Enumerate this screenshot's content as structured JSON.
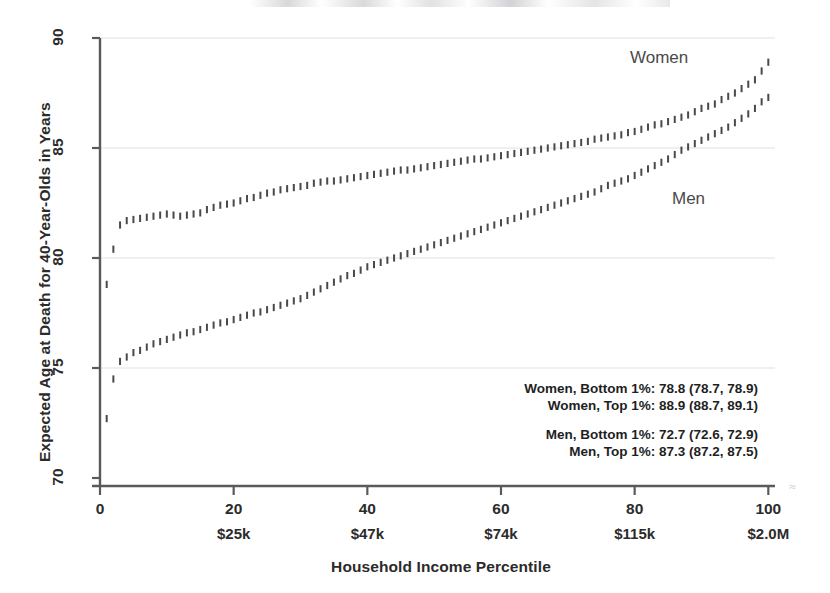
{
  "chart_data": {
    "type": "scatter",
    "title": "",
    "xlabel": "Household Income Percentile",
    "ylabel": "Expected Age at Death for 40-Year-Olds in Years",
    "xlim": [
      0,
      101
    ],
    "ylim": [
      70,
      90
    ],
    "xticks": [
      0,
      20,
      40,
      60,
      80,
      100
    ],
    "xtick_labels": [
      "0",
      "20",
      "40",
      "60",
      "80",
      "100"
    ],
    "secondary_xtick_labels": [
      "",
      "$25k",
      "$47k",
      "$74k",
      "$115k",
      "$2.0M"
    ],
    "yticks": [
      70,
      75,
      80,
      85,
      90
    ],
    "ytick_labels": [
      "70",
      "75",
      "80",
      "85",
      "90"
    ],
    "grid": "horizontal",
    "legend_position": "inline-annotation",
    "marker": "error-bar",
    "series": [
      {
        "name": "Women",
        "color": "#3a3a3a",
        "label_x": 630,
        "label_y": 48,
        "x": [
          1,
          2,
          3,
          4,
          5,
          6,
          7,
          8,
          9,
          10,
          11,
          12,
          13,
          14,
          15,
          16,
          17,
          18,
          19,
          20,
          21,
          22,
          23,
          24,
          25,
          26,
          27,
          28,
          29,
          30,
          31,
          32,
          33,
          34,
          35,
          36,
          37,
          38,
          39,
          40,
          41,
          42,
          43,
          44,
          45,
          46,
          47,
          48,
          49,
          50,
          51,
          52,
          53,
          54,
          55,
          56,
          57,
          58,
          59,
          60,
          61,
          62,
          63,
          64,
          65,
          66,
          67,
          68,
          69,
          70,
          71,
          72,
          73,
          74,
          75,
          76,
          77,
          78,
          79,
          80,
          81,
          82,
          83,
          84,
          85,
          86,
          87,
          88,
          89,
          90,
          91,
          92,
          93,
          94,
          95,
          96,
          97,
          98,
          99,
          100
        ],
        "values": [
          78.8,
          80.4,
          81.5,
          81.7,
          81.75,
          81.8,
          81.85,
          81.9,
          81.95,
          82.0,
          81.95,
          81.9,
          81.95,
          82.0,
          82.05,
          82.2,
          82.3,
          82.4,
          82.45,
          82.5,
          82.6,
          82.7,
          82.75,
          82.85,
          82.95,
          83.0,
          83.1,
          83.15,
          83.2,
          83.25,
          83.3,
          83.4,
          83.45,
          83.5,
          83.5,
          83.55,
          83.6,
          83.65,
          83.7,
          83.75,
          83.8,
          83.85,
          83.9,
          83.95,
          84.0,
          84.0,
          84.05,
          84.1,
          84.15,
          84.2,
          84.25,
          84.3,
          84.35,
          84.4,
          84.45,
          84.5,
          84.5,
          84.55,
          84.6,
          84.65,
          84.7,
          84.75,
          84.8,
          84.85,
          84.9,
          84.95,
          85.0,
          85.05,
          85.1,
          85.15,
          85.2,
          85.25,
          85.3,
          85.4,
          85.45,
          85.5,
          85.55,
          85.6,
          85.7,
          85.75,
          85.85,
          85.95,
          86.05,
          86.1,
          86.2,
          86.3,
          86.4,
          86.5,
          86.65,
          86.8,
          86.9,
          87.0,
          87.2,
          87.35,
          87.5,
          87.7,
          87.9,
          88.1,
          88.5,
          88.9
        ]
      },
      {
        "name": "Men",
        "color": "#3a3a3a",
        "label_x": 672,
        "label_y": 189,
        "x": [
          1,
          2,
          3,
          4,
          5,
          6,
          7,
          8,
          9,
          10,
          11,
          12,
          13,
          14,
          15,
          16,
          17,
          18,
          19,
          20,
          21,
          22,
          23,
          24,
          25,
          26,
          27,
          28,
          29,
          30,
          31,
          32,
          33,
          34,
          35,
          36,
          37,
          38,
          39,
          40,
          41,
          42,
          43,
          44,
          45,
          46,
          47,
          48,
          49,
          50,
          51,
          52,
          53,
          54,
          55,
          56,
          57,
          58,
          59,
          60,
          61,
          62,
          63,
          64,
          65,
          66,
          67,
          68,
          69,
          70,
          71,
          72,
          73,
          74,
          75,
          76,
          77,
          78,
          79,
          80,
          81,
          82,
          83,
          84,
          85,
          86,
          87,
          88,
          89,
          90,
          91,
          92,
          93,
          94,
          95,
          96,
          97,
          98,
          99,
          100
        ],
        "values": [
          72.7,
          74.5,
          75.3,
          75.5,
          75.7,
          75.8,
          75.95,
          76.1,
          76.2,
          76.3,
          76.4,
          76.5,
          76.6,
          76.65,
          76.75,
          76.85,
          76.95,
          77.05,
          77.1,
          77.2,
          77.3,
          77.4,
          77.5,
          77.55,
          77.65,
          77.75,
          77.85,
          77.95,
          78.05,
          78.15,
          78.3,
          78.45,
          78.6,
          78.75,
          78.9,
          79.05,
          79.2,
          79.3,
          79.45,
          79.6,
          79.7,
          79.8,
          79.9,
          80.0,
          80.1,
          80.2,
          80.3,
          80.4,
          80.5,
          80.6,
          80.7,
          80.8,
          80.9,
          81.0,
          81.1,
          81.2,
          81.3,
          81.4,
          81.5,
          81.6,
          81.7,
          81.8,
          81.9,
          82.0,
          82.1,
          82.2,
          82.3,
          82.4,
          82.5,
          82.6,
          82.7,
          82.8,
          82.9,
          83.0,
          83.15,
          83.3,
          83.4,
          83.5,
          83.6,
          83.75,
          83.9,
          84.05,
          84.2,
          84.35,
          84.5,
          84.7,
          84.9,
          85.05,
          85.2,
          85.35,
          85.5,
          85.65,
          85.8,
          85.95,
          86.15,
          86.35,
          86.55,
          86.8,
          87.1,
          87.3
        ]
      }
    ],
    "annotations": [
      "Women, Bottom 1%: 78.8 (78.7, 78.9)",
      "Women, Top 1%: 88.9 (88.7, 89.1)",
      "",
      "Men, Bottom 1%: 72.7 (72.6, 72.9)",
      "Men, Top 1%: 87.3 (87.2, 87.5)"
    ]
  },
  "style": {
    "axis_color": "#5a5a5a",
    "grid_color": "#e2e2e4",
    "text_color": "#2b2b2b",
    "marker_color": "#3a3a3a",
    "background": "#ffffff"
  }
}
